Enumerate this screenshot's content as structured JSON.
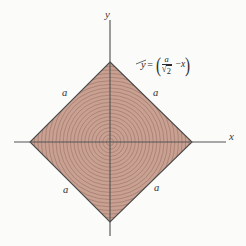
{
  "figure": {
    "name": "square-region-rotated-45-with-concentric-circles",
    "background_color": "#fbfbfa",
    "axes": {
      "x_label": "x",
      "y_label": "y",
      "axis_color": "#555555",
      "origin": {
        "x": 110,
        "y": 142
      }
    },
    "region": {
      "fill_color": "#c8a193",
      "edge_color": "#4a4a4a",
      "vertices": [
        {
          "x": 110,
          "y": 62
        },
        {
          "x": 192,
          "y": 142
        },
        {
          "x": 110,
          "y": 222
        },
        {
          "x": 30,
          "y": 142
        }
      ]
    },
    "contours": {
      "description": "concentric-circles",
      "color": "#9c7063",
      "count": 22,
      "spacing": 3.6
    },
    "side_labels": [
      {
        "text": "a",
        "x": 62,
        "y": 88
      },
      {
        "text": "a",
        "x": 153,
        "y": 88
      },
      {
        "text": "a",
        "x": 63,
        "y": 185
      },
      {
        "text": "a",
        "x": 154,
        "y": 183
      }
    ],
    "equation": {
      "lhs": "y",
      "equals": "=",
      "paren_open": "(",
      "numerator": "a",
      "radical": "√",
      "denominator": "2",
      "minus": "−",
      "variable": "x",
      "paren_close": ")",
      "full_text": "y = (a/√2 − x)"
    }
  }
}
